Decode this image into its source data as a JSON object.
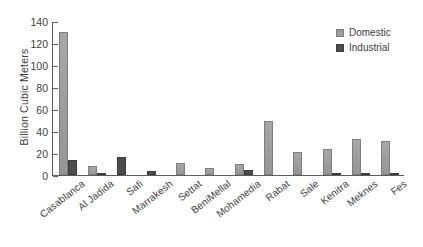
{
  "chart_data": {
    "type": "bar",
    "title": "",
    "xlabel": "",
    "ylabel": "Billion Cubic Meters",
    "ylim": [
      0,
      140
    ],
    "yticks": [
      0,
      20,
      40,
      60,
      80,
      100,
      120,
      140
    ],
    "grid": false,
    "legend_position": "top-right",
    "categories": [
      "Casablanca",
      "Al Jadida",
      "Safi",
      "Marrakesh",
      "Settat",
      "BeniMellal",
      "Mohamedia",
      "Rabat",
      "Sale",
      "Kenitra",
      "Meknes",
      "Fes"
    ],
    "series": [
      {
        "name": "Domestic",
        "color": "#9d9d9d",
        "values": [
          130,
          8,
          0,
          0,
          11,
          6,
          10,
          49,
          21,
          24,
          33,
          31
        ]
      },
      {
        "name": "Industrial",
        "color": "#4d4d4d",
        "values": [
          14,
          1,
          16,
          4,
          0,
          0,
          5,
          0,
          0,
          1,
          1,
          1
        ]
      }
    ]
  },
  "legend": {
    "items": [
      {
        "label": "Domestic",
        "swatch": "domestic"
      },
      {
        "label": "Industrial",
        "swatch": "industrial"
      }
    ]
  }
}
